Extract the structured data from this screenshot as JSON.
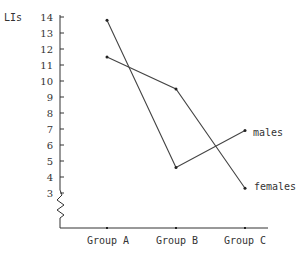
{
  "chart_data": {
    "type": "line",
    "title": "",
    "xlabel": "",
    "ylabel": "LIs",
    "categories": [
      "Group A",
      "Group B",
      "Group C"
    ],
    "series": [
      {
        "name": "males",
        "values": [
          13.8,
          4.6,
          6.9
        ]
      },
      {
        "name": "females",
        "values": [
          11.5,
          9.5,
          3.3
        ]
      }
    ],
    "yticks": [
      3,
      4,
      5,
      6,
      7,
      8,
      9,
      10,
      11,
      12,
      13,
      14
    ],
    "ylim": [
      3,
      14
    ],
    "axis_break": true,
    "grid": false,
    "legend": "inline labels at line ends"
  },
  "labels": {
    "ylabel": "LIs",
    "males": "males",
    "females": "females",
    "groupA": "Group A",
    "groupB": "Group B",
    "groupC": "Group C"
  }
}
